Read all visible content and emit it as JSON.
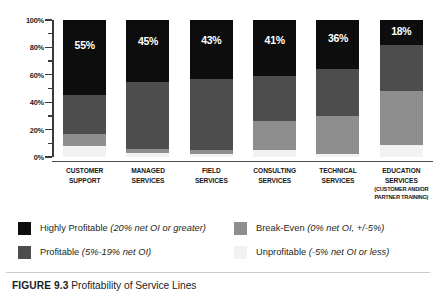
{
  "caption": {
    "figure_number": "FIGURE 9.3",
    "text": "Profitability of Service Lines"
  },
  "axis": {
    "y_ticks": [
      "0%",
      "20%",
      "40%",
      "60%",
      "80%",
      "100%"
    ],
    "y_minor_ticks": [
      "10%",
      "30%",
      "50%",
      "70%",
      "90%"
    ]
  },
  "legend": {
    "items": [
      {
        "label": "Highly Profitable",
        "detail": "(20% net OI or greater)",
        "color": "#0d0d0d"
      },
      {
        "label": "Profitable",
        "detail": "(5%-19% net OI)",
        "color": "#4d4d4d"
      },
      {
        "label": "Break-Even",
        "detail": "(0% net OI, +/-5%)",
        "color": "#8e8e8e"
      },
      {
        "label": "Unprofitable",
        "detail": "(-5% net OI or less)",
        "color": "#f2f2f2"
      }
    ]
  },
  "chart_data": {
    "type": "bar",
    "stacked": true,
    "title": "Profitability of Service Lines",
    "xlabel": "",
    "ylabel": "",
    "ylim": [
      0,
      100
    ],
    "grid": false,
    "legend_position": "bottom",
    "categories": [
      "CUSTOMER SUPPORT",
      "MANAGED SERVICES",
      "FIELD SERVICES",
      "CONSULTING SERVICES",
      "TECHNICAL SERVICES",
      "EDUCATION SERVICES (CUSTOMER AND/OR PARTNER TRAINING)"
    ],
    "category_lines": [
      [
        "CUSTOMER",
        "SUPPORT"
      ],
      [
        "MANAGED",
        "SERVICES"
      ],
      [
        "FIELD",
        "SERVICES"
      ],
      [
        "CONSULTING",
        "SERVICES"
      ],
      [
        "TECHNICAL",
        "SERVICES"
      ],
      [
        "EDUCATION",
        "SERVICES"
      ]
    ],
    "category_sublines": [
      [],
      [],
      [],
      [],
      [],
      [
        "(CUSTOMER AND/OR",
        "PARTNER TRAINING)"
      ]
    ],
    "series": [
      {
        "name": "Highly Profitable",
        "color": "#0d0d0d",
        "values": [
          55,
          45,
          43,
          41,
          36,
          18
        ],
        "labeled": true
      },
      {
        "name": "Profitable",
        "color": "#4d4d4d",
        "values": [
          28,
          49,
          52,
          33,
          34,
          34
        ],
        "labeled": false
      },
      {
        "name": "Break-Even",
        "color": "#8e8e8e",
        "values": [
          9,
          3,
          3,
          21,
          28,
          39
        ],
        "labeled": false
      },
      {
        "name": "Unprofitable",
        "color": "#f2f2f2",
        "values": [
          8,
          3,
          2,
          5,
          2,
          9
        ],
        "labeled": false
      }
    ],
    "data_labels": [
      "55%",
      "45%",
      "43%",
      "41%",
      "36%",
      "18%"
    ]
  }
}
